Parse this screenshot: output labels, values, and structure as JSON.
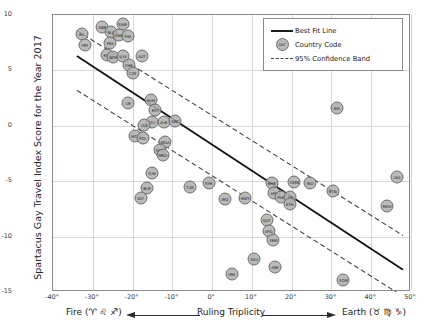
{
  "axes": {
    "y_title": "Spartacus Gay Travel Index Score for the Year 2017",
    "y_ticks": [
      "10",
      "5",
      "0",
      "-5",
      "-10",
      "-15"
    ],
    "x_ticks": [
      "-40°",
      "-30°",
      "-20°",
      "-10°",
      "0°",
      "10°",
      "20°",
      "30°",
      "40°",
      "50°"
    ],
    "x_caption_left": "Fire (♈ ♌ ♐)",
    "x_caption_mid": "Ruling Triplicity",
    "x_caption_right": "Earth (♉ ♍ ♑)"
  },
  "legend": {
    "items": [
      {
        "symbol": "solid-line",
        "label": "Best Fit Line"
      },
      {
        "symbol": "bubble",
        "label": "Country Code",
        "bubble_text": "ABC"
      },
      {
        "symbol": "dashed-line",
        "label": "95% Confidence Band"
      }
    ]
  },
  "chart_data": {
    "type": "scatter",
    "title": "",
    "xlabel": "Ruling Triplicity",
    "ylabel": "Spartacus Gay Travel Index Score for the Year 2017",
    "xlim": [
      -40,
      50
    ],
    "ylim": [
      -15,
      10
    ],
    "grid": true,
    "legend_position": "top-right",
    "point_label_key": "Country Code",
    "best_fit_line": {
      "x": [
        -34,
        48
      ],
      "y": [
        6.3,
        -13.0
      ]
    },
    "confidence_band_upper": {
      "x": [
        -34,
        48
      ],
      "y": [
        8.6,
        -9.9
      ]
    },
    "confidence_band_lower": {
      "x": [
        -34,
        48
      ],
      "y": [
        3.2,
        -15.4
      ]
    },
    "points": [
      {
        "label": "IRL",
        "x": -32.8,
        "y": 8.3
      },
      {
        "label": "PRT",
        "x": -32.0,
        "y": 7.3
      },
      {
        "label": "GBR",
        "x": -27.6,
        "y": 8.9
      },
      {
        "label": "NLD",
        "x": -25.4,
        "y": 8.5
      },
      {
        "label": "SWE",
        "x": -22.5,
        "y": 9.2
      },
      {
        "label": "DNK",
        "x": -23.5,
        "y": 8.2
      },
      {
        "label": "FIN",
        "x": -21.2,
        "y": 8.1
      },
      {
        "label": "FRA",
        "x": -25.6,
        "y": 7.5
      },
      {
        "label": "ESP",
        "x": -26.4,
        "y": 6.4
      },
      {
        "label": "NOR",
        "x": -24.8,
        "y": 6.2
      },
      {
        "label": "LUX",
        "x": -22.4,
        "y": 6.3
      },
      {
        "label": "AUT",
        "x": -17.7,
        "y": 6.3
      },
      {
        "label": "CHE",
        "x": -21.0,
        "y": 5.5
      },
      {
        "label": "CZE",
        "x": -20.0,
        "y": 4.8
      },
      {
        "label": "LIE",
        "x": -21.1,
        "y": 2.1
      },
      {
        "label": "HUN",
        "x": -15.4,
        "y": 2.3
      },
      {
        "label": "EST",
        "x": -14.3,
        "y": 1.4
      },
      {
        "label": "LTU",
        "x": -15.2,
        "y": 0.3
      },
      {
        "label": "LVA",
        "x": -17.0,
        "y": 0.1
      },
      {
        "label": "ALB",
        "x": -12.2,
        "y": 0.3
      },
      {
        "label": "GRC",
        "x": -9.3,
        "y": 0.4
      },
      {
        "label": "MCO",
        "x": -19.3,
        "y": -0.9
      },
      {
        "label": "POL",
        "x": -17.4,
        "y": -1.1
      },
      {
        "label": "MDA",
        "x": -11.8,
        "y": -1.5
      },
      {
        "label": "SRB",
        "x": -13.2,
        "y": -2.2
      },
      {
        "label": "MKD",
        "x": -12.4,
        "y": -2.6
      },
      {
        "label": "TUN",
        "x": -15.2,
        "y": -4.3
      },
      {
        "label": "BLR",
        "x": -16.4,
        "y": -5.6
      },
      {
        "label": "VAT",
        "x": -18.0,
        "y": -6.5
      },
      {
        "label": "TUR",
        "x": -5.6,
        "y": -5.5
      },
      {
        "label": "SYR",
        "x": -0.9,
        "y": -5.2
      },
      {
        "label": "IRQ",
        "x": 3.2,
        "y": -6.6
      },
      {
        "label": "KWT",
        "x": 8.3,
        "y": -6.5
      },
      {
        "label": "BHR",
        "x": 15.0,
        "y": -5.2
      },
      {
        "label": "ARE",
        "x": 15.6,
        "y": -6.1
      },
      {
        "label": "PAK",
        "x": 17.3,
        "y": -6.4
      },
      {
        "label": "DJI",
        "x": 19.7,
        "y": -6.4
      },
      {
        "label": "OMN",
        "x": 20.7,
        "y": -5.1
      },
      {
        "label": "ETH",
        "x": 19.5,
        "y": -7.1
      },
      {
        "label": "IND",
        "x": 24.6,
        "y": -5.2
      },
      {
        "label": "BTN",
        "x": 30.3,
        "y": -5.9
      },
      {
        "label": "LKA",
        "x": 46.5,
        "y": -4.6
      },
      {
        "label": "MDV",
        "x": 44.0,
        "y": -7.2
      },
      {
        "label": "QAT",
        "x": 13.7,
        "y": -8.5
      },
      {
        "label": "AFG",
        "x": 14.2,
        "y": -9.5
      },
      {
        "label": "YEM",
        "x": 15.4,
        "y": -10.3
      },
      {
        "label": "SAU",
        "x": 10.6,
        "y": -12.0
      },
      {
        "label": "ARE",
        "x": 15.8,
        "y": -12.7
      },
      {
        "label": "IRN",
        "x": 4.9,
        "y": -13.4
      },
      {
        "label": "SOM",
        "x": 33.0,
        "y": -13.9
      },
      {
        "label": "NPL",
        "x": 31.4,
        "y": 1.6
      }
    ]
  }
}
